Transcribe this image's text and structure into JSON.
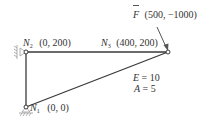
{
  "diagram": {
    "type": "truss",
    "colors": {
      "member": "#3a3a3a",
      "node_fill": "#ffffff",
      "support": "#9a9a9a",
      "text": "#333333"
    },
    "nodes": [
      {
        "id": "N1",
        "symbol": "N",
        "index": "1",
        "coords": "(0, 0)",
        "x": 0,
        "y": 0,
        "support": "pin"
      },
      {
        "id": "N2",
        "symbol": "N",
        "index": "2",
        "coords": "(0, 200)",
        "x": 0,
        "y": 200,
        "support": "pin-wall"
      },
      {
        "id": "N3",
        "symbol": "N",
        "index": "3",
        "coords": "(400, 200)",
        "x": 400,
        "y": 200,
        "support": "none"
      }
    ],
    "members": [
      {
        "from": "N1",
        "to": "N2"
      },
      {
        "from": "N2",
        "to": "N3"
      },
      {
        "from": "N1",
        "to": "N3"
      }
    ],
    "force": {
      "symbol": "F",
      "vector_mark": "→",
      "value": "(500, −1000)",
      "applied_at": "N3"
    },
    "properties": {
      "E_label": "E",
      "E_value": "= 10",
      "A_label": "A",
      "A_value": "= 5"
    }
  }
}
